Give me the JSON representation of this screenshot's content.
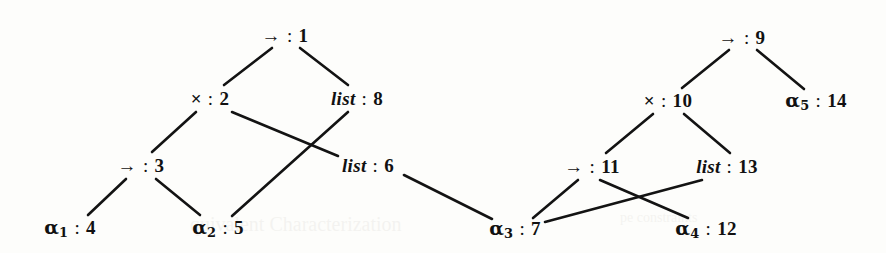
{
  "figure": {
    "kind": "typing-derivation-tree-pair",
    "background_color": "#fdfdfb",
    "ink_color": "#111111",
    "width": 886,
    "height": 253
  },
  "nodes": [
    {
      "id": "n1",
      "symbol": "→",
      "symbol_kind": "arrow",
      "sub": "",
      "sep": ":",
      "number": "1",
      "label": "→ : 1",
      "x": 285,
      "y": 35
    },
    {
      "id": "n2",
      "symbol": "×",
      "symbol_kind": "times",
      "sub": "",
      "sep": ":",
      "number": "2",
      "label": "× : 2",
      "x": 210,
      "y": 98
    },
    {
      "id": "n8",
      "symbol": "list",
      "symbol_kind": "keyword",
      "sub": "",
      "sep": ":",
      "number": "8",
      "label": "list : 8",
      "x": 357,
      "y": 98
    },
    {
      "id": "n3",
      "symbol": "→",
      "symbol_kind": "arrow",
      "sub": "",
      "sep": ":",
      "number": "3",
      "label": "→ : 3",
      "x": 141,
      "y": 165
    },
    {
      "id": "n6",
      "symbol": "list",
      "symbol_kind": "keyword",
      "sub": "",
      "sep": ":",
      "number": "6",
      "label": "list : 6",
      "x": 368,
      "y": 165
    },
    {
      "id": "n4",
      "symbol": "α",
      "symbol_kind": "alpha",
      "sub": "1",
      "sep": ":",
      "number": "4",
      "label": "α₁ : 4",
      "x": 70,
      "y": 229
    },
    {
      "id": "n5",
      "symbol": "α",
      "symbol_kind": "alpha",
      "sub": "2",
      "sep": ":",
      "number": "5",
      "label": "α₂ : 5",
      "x": 218,
      "y": 229
    },
    {
      "id": "n9",
      "symbol": "→",
      "symbol_kind": "arrow",
      "sub": "",
      "sep": ":",
      "number": "9",
      "label": "→ : 9",
      "x": 742,
      "y": 37
    },
    {
      "id": "n10",
      "symbol": "×",
      "symbol_kind": "times",
      "sub": "",
      "sep": ":",
      "number": "10",
      "label": "× : 10",
      "x": 668,
      "y": 100
    },
    {
      "id": "n14",
      "symbol": "α",
      "symbol_kind": "alpha",
      "sub": "5",
      "sep": ":",
      "number": "14",
      "label": "α₅ : 14",
      "x": 816,
      "y": 102
    },
    {
      "id": "n11",
      "symbol": "→",
      "symbol_kind": "arrow",
      "sub": "",
      "sep": ":",
      "number": "11",
      "label": "→ : 11",
      "x": 592,
      "y": 166
    },
    {
      "id": "n13",
      "symbol": "list",
      "symbol_kind": "keyword",
      "sub": "",
      "sep": ":",
      "number": "13",
      "label": "list : 13",
      "x": 727,
      "y": 166
    },
    {
      "id": "n7",
      "symbol": "α",
      "symbol_kind": "alpha",
      "sub": "3",
      "sep": ":",
      "number": "7",
      "label": "α₃ : 7",
      "x": 515,
      "y": 230
    },
    {
      "id": "n12",
      "symbol": "α",
      "symbol_kind": "alpha",
      "sub": "4",
      "sep": ":",
      "number": "12",
      "label": "α₄ : 12",
      "x": 706,
      "y": 230
    }
  ],
  "edges": [
    {
      "id": "e1",
      "from": "n1",
      "to": "n2",
      "x1": 272,
      "y1": 48,
      "x2": 224,
      "y2": 85
    },
    {
      "id": "e2",
      "from": "n1",
      "to": "n8",
      "x1": 300,
      "y1": 48,
      "x2": 348,
      "y2": 85
    },
    {
      "id": "e3",
      "from": "n2",
      "to": "n3",
      "x1": 196,
      "y1": 112,
      "x2": 152,
      "y2": 152
    },
    {
      "id": "e4",
      "from": "n2",
      "to": "n6",
      "x1": 232,
      "y1": 112,
      "x2": 338,
      "y2": 156
    },
    {
      "id": "e5",
      "from": "n3",
      "to": "n4",
      "x1": 126,
      "y1": 179,
      "x2": 88,
      "y2": 215
    },
    {
      "id": "e6",
      "from": "n3",
      "to": "n5",
      "x1": 156,
      "y1": 179,
      "x2": 200,
      "y2": 215
    },
    {
      "id": "e7",
      "from": "n8",
      "to": "n5",
      "x1": 348,
      "y1": 112,
      "x2": 232,
      "y2": 216
    },
    {
      "id": "e8",
      "from": "n6",
      "to": "n7",
      "x1": 404,
      "y1": 175,
      "x2": 492,
      "y2": 219
    },
    {
      "id": "e9",
      "from": "n9",
      "to": "n10",
      "x1": 729,
      "y1": 50,
      "x2": 682,
      "y2": 88
    },
    {
      "id": "e10",
      "from": "n9",
      "to": "n14",
      "x1": 757,
      "y1": 50,
      "x2": 804,
      "y2": 89
    },
    {
      "id": "e11",
      "from": "n10",
      "to": "n11",
      "x1": 653,
      "y1": 114,
      "x2": 606,
      "y2": 153
    },
    {
      "id": "e12",
      "from": "n10",
      "to": "n13",
      "x1": 684,
      "y1": 114,
      "x2": 730,
      "y2": 153
    },
    {
      "id": "e13",
      "from": "n11",
      "to": "n7",
      "x1": 578,
      "y1": 180,
      "x2": 533,
      "y2": 218
    },
    {
      "id": "e14",
      "from": "n11",
      "to": "n12",
      "x1": 600,
      "y1": 180,
      "x2": 688,
      "y2": 218
    },
    {
      "id": "e15",
      "from": "n13",
      "to": "n7",
      "x1": 702,
      "y1": 180,
      "x2": 545,
      "y2": 222
    }
  ],
  "background_text": [
    {
      "id": "bg1",
      "text": "quivalent Characterization",
      "x": 190,
      "y": 213,
      "size": 20
    },
    {
      "id": "bg2",
      "text": "pe constraints",
      "x": 620,
      "y": 210,
      "size": 14
    }
  ]
}
